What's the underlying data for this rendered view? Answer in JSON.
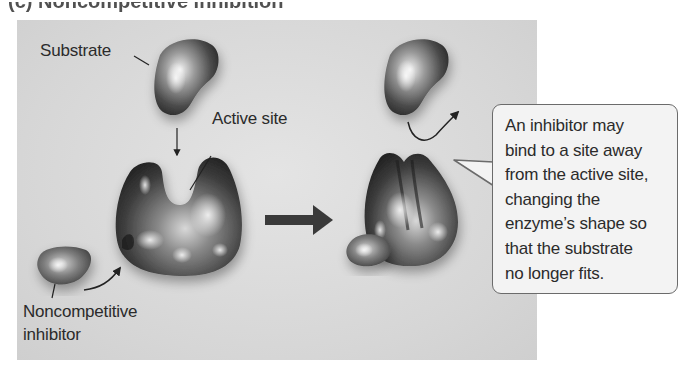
{
  "figure": {
    "partial_title": "(c) Noncompetitive inhibition",
    "labels": {
      "substrate": "Substrate",
      "active_site": "Active site",
      "inhibitor_line1": "Noncompetitive",
      "inhibitor_line2": "inhibitor"
    },
    "callout": {
      "lines": [
        "An inhibitor may",
        "bind to a site away",
        "from the active site,",
        "changing the",
        "enzyme’s shape so",
        "that the substrate",
        "no longer fits."
      ]
    },
    "colors": {
      "panel_bg": "#d9d9d9",
      "callout_bg": "#f3f3f3",
      "callout_border": "#6b6b6b",
      "arrow": "#3a3a3a",
      "text": "#2b2b2b"
    }
  }
}
